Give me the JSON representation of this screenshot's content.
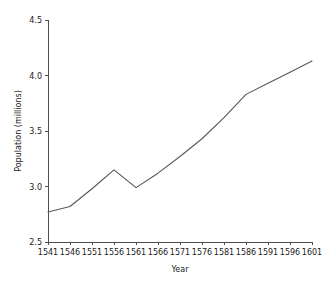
{
  "chart_data": {
    "type": "line",
    "title": "",
    "subtitle": "",
    "xlabel": "Year",
    "ylabel": "Population (millions)",
    "x": [
      1541,
      1546,
      1551,
      1556,
      1561,
      1566,
      1571,
      1576,
      1581,
      1586,
      1591,
      1596,
      1601
    ],
    "values": [
      2.77,
      2.82,
      2.98,
      3.15,
      2.99,
      3.12,
      3.27,
      3.43,
      3.62,
      3.83,
      3.93,
      4.03,
      4.13
    ],
    "series": [
      {
        "name": "Population",
        "values": [
          2.77,
          2.82,
          2.98,
          3.15,
          2.99,
          3.12,
          3.27,
          3.43,
          3.62,
          3.83,
          3.93,
          4.03,
          4.13
        ]
      }
    ],
    "categories": [
      "1541",
      "1546",
      "1551",
      "1556",
      "1561",
      "1566",
      "1571",
      "1576",
      "1581",
      "1586",
      "1591",
      "1596",
      "1601"
    ],
    "xlim": [
      1541,
      1601
    ],
    "ylim": [
      2.5,
      4.5
    ],
    "xticks": [
      1541,
      1546,
      1551,
      1556,
      1561,
      1566,
      1571,
      1576,
      1581,
      1586,
      1591,
      1596,
      1601
    ],
    "xtick_labels": [
      "1541",
      "1546",
      "1551",
      "1556",
      "1561",
      "1566",
      "1571",
      "1576",
      "1581",
      "1586",
      "1591",
      "1596",
      "1601"
    ],
    "yticks": [
      2.5,
      3.0,
      3.5,
      4.0,
      4.5
    ],
    "ytick_labels": [
      "2.5",
      "3.0",
      "3.5",
      "4.0",
      "4.5"
    ],
    "grid": false,
    "legend": false,
    "legend_position": "none",
    "line_color": "#56565c",
    "axis_color": "#4d4d4d",
    "background_color": "#ffffff",
    "annotations": []
  },
  "axes": {
    "y_title": "Population (millions)",
    "x_title": "Year"
  }
}
